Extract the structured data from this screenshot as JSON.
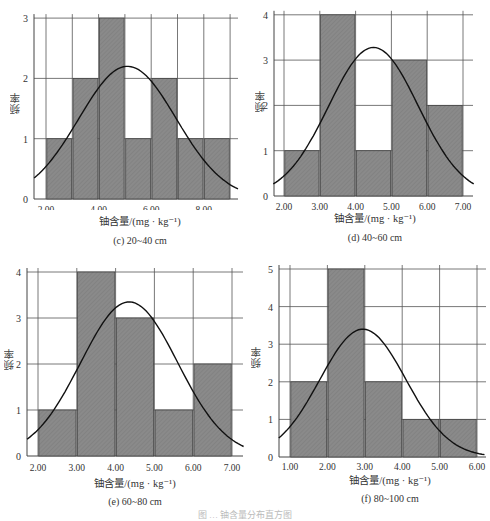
{
  "chart_data": [
    {
      "id": "c",
      "type": "bar",
      "subtype": "histogram-with-normal-curve",
      "title": "(c) 20~40 cm",
      "xlabel": "铀含量/(mg · kg⁻¹)",
      "ylabel": "频率",
      "xticks": [
        "2.00",
        "4.00",
        "6.00",
        "8.00"
      ],
      "yticks": [
        "0",
        "1",
        "2",
        "3"
      ],
      "ylim": [
        0,
        3
      ],
      "bins": [
        [
          2.0,
          3.0
        ],
        [
          3.0,
          4.0
        ],
        [
          4.0,
          5.0
        ],
        [
          5.0,
          6.0
        ],
        [
          6.0,
          7.0
        ],
        [
          7.0,
          8.0
        ],
        [
          8.0,
          9.0
        ]
      ],
      "values": [
        1,
        2,
        3,
        1,
        2,
        1,
        1
      ],
      "normal_curve": {
        "mean": 5.1,
        "peak": 2.2
      },
      "grid": true
    },
    {
      "id": "d",
      "type": "bar",
      "subtype": "histogram-with-normal-curve",
      "title": "(d) 40~60 cm",
      "xlabel": "铀含量/(mg · kg⁻¹)",
      "ylabel": "频率",
      "xticks": [
        "2.00",
        "3.00",
        "4.00",
        "5.00",
        "6.00",
        "7.00"
      ],
      "yticks": [
        "0",
        "1",
        "2",
        "3",
        "4"
      ],
      "ylim": [
        0,
        4
      ],
      "bins": [
        [
          2.0,
          3.0
        ],
        [
          3.0,
          4.0
        ],
        [
          4.0,
          5.0
        ],
        [
          5.0,
          6.0
        ],
        [
          6.0,
          7.0
        ]
      ],
      "values": [
        1,
        4,
        1,
        3,
        2
      ],
      "normal_curve": {
        "mean": 4.5,
        "peak": 3.28
      },
      "grid": true
    },
    {
      "id": "e",
      "type": "bar",
      "subtype": "histogram-with-normal-curve",
      "title": "(e) 60~80 cm",
      "xlabel": "铀含量/(mg · kg⁻¹)",
      "ylabel": "频率",
      "xticks": [
        "2.00",
        "3.00",
        "4.00",
        "5.00",
        "6.00",
        "7.00"
      ],
      "yticks": [
        "0",
        "1",
        "2",
        "3",
        "4"
      ],
      "ylim": [
        0,
        4
      ],
      "bins": [
        [
          2.0,
          3.0
        ],
        [
          3.0,
          4.0
        ],
        [
          4.0,
          5.0
        ],
        [
          5.0,
          6.0
        ],
        [
          6.0,
          7.0
        ]
      ],
      "values": [
        1,
        4,
        3,
        1,
        2
      ],
      "normal_curve": {
        "mean": 4.35,
        "peak": 3.35
      },
      "grid": true
    },
    {
      "id": "f",
      "type": "bar",
      "subtype": "histogram-with-normal-curve",
      "title": "(f) 80~100 cm",
      "xlabel": "铀含量/(mg · kg⁻¹)",
      "ylabel": "频率",
      "xticks": [
        "1.00",
        "2.00",
        "3.00",
        "4.00",
        "5.00",
        "6.00"
      ],
      "yticks": [
        "0",
        "1",
        "2",
        "3",
        "4",
        "5"
      ],
      "ylim": [
        0,
        5
      ],
      "bins": [
        [
          1.0,
          2.0
        ],
        [
          2.0,
          3.0
        ],
        [
          3.0,
          4.0
        ],
        [
          4.0,
          5.0
        ],
        [
          5.0,
          6.0
        ]
      ],
      "values": [
        2,
        5,
        2,
        1,
        1
      ],
      "normal_curve": {
        "mean": 2.95,
        "peak": 3.4
      },
      "grid": true
    }
  ],
  "figure_caption": "图 … 铀含量分布直方图"
}
